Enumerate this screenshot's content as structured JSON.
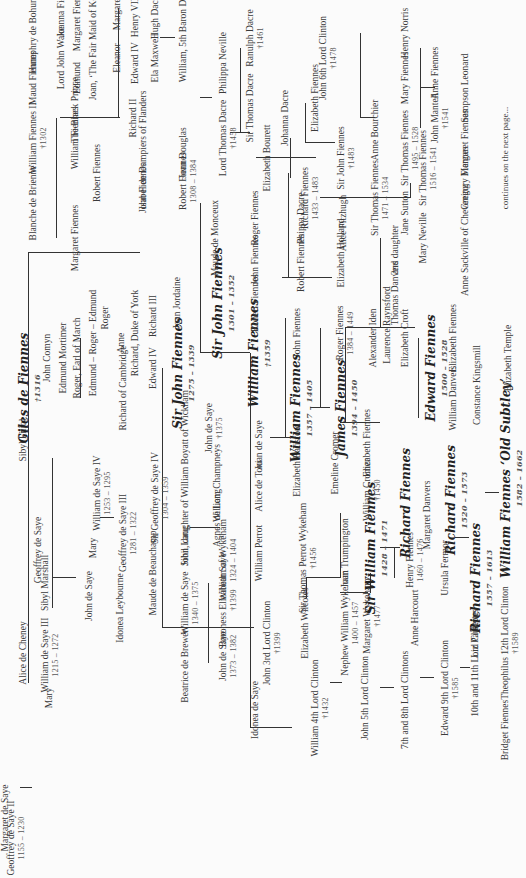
{
  "tree_title": "Fiennes family tree",
  "marriage_symbol": "∞",
  "people": [
    {
      "id": "geoffrey2",
      "name": "Geoffrey de Saye II",
      "dates": "1155 – 1230",
      "u": 40,
      "v": 6
    },
    {
      "id": "margaret_ws",
      "name": "Margaret de Saye",
      "u": 60,
      "v": -2
    },
    {
      "id": "alice_cheney",
      "name": "Alice de Cheney",
      "u": 225,
      "v": 18
    },
    {
      "id": "mary1",
      "name": "Mary",
      "u": 180,
      "v": 44
    },
    {
      "id": "william3",
      "name": "William de Saye III",
      "dates": "1215 – 1272",
      "u": 223,
      "v": 40
    },
    {
      "id": "sibyl_marshall",
      "name": "Sibyl Marshall",
      "u": 295,
      "v": 40
    },
    {
      "id": "geoffrey_de_saye_b",
      "name": "Geoffrey de Saye",
      "u": 328,
      "v": 33
    },
    {
      "id": "john_de_saye1",
      "name": "John de Saye",
      "u": 282,
      "v": 84
    },
    {
      "id": "mary2",
      "name": "Mary",
      "u": 330,
      "v": 88
    },
    {
      "id": "william4",
      "name": "William de Saye IV",
      "dates": "1253 – 1295",
      "u": 385,
      "v": 92
    },
    {
      "id": "sibyl_filiol",
      "name": "Sibyl Filiol",
      "u": 438,
      "v": 18
    },
    {
      "id": "idonea_leybourne",
      "name": "Idonea Leybourne",
      "u": 270,
      "v": 115
    },
    {
      "id": "geoffrey3",
      "name": "Geoffrey de Saye III",
      "dates": "1281 – 1322",
      "u": 345,
      "v": 118
    },
    {
      "id": "maude_beauchamp",
      "name": "Maude de Beauchamp",
      "u": 305,
      "v": 148
    },
    {
      "id": "geoffrey4",
      "name": "Sir Geoffrey de Saye IV",
      "dates": "1304 – 1359",
      "u": 380,
      "v": 150
    },
    {
      "id": "beatrice",
      "name": "Beatrice de Brewer",
      "u": 212,
      "v": 180
    },
    {
      "id": "william_ds",
      "name": "William de Saye",
      "dates": "1340 – 1375",
      "u": 275,
      "v": 180
    },
    {
      "id": "john_lang",
      "name": "John Lang",
      "u": 332,
      "v": 180
    },
    {
      "id": "sibil_boyatt",
      "name": "Sibil, daughter of William Boyatt of Wickham",
      "u": 400,
      "v": 180
    },
    {
      "id": "john_ds2",
      "name": "John de Saye",
      "dates": "1373 – 1382",
      "u": 222,
      "v": 218
    },
    {
      "id": "baroness_eliz",
      "name": "Baroness Elizabeth Saye",
      "dates": "†1399",
      "u": 278,
      "v": 218
    },
    {
      "id": "william_wykeham",
      "name": "William of Wykeham",
      "dates": "1324 – 1404",
      "u": 318,
      "v": 218
    },
    {
      "id": "agnes",
      "name": "Agnes de Long",
      "u": 360,
      "v": 212
    },
    {
      "id": "w_champneys",
      "name": "William Champneys",
      "u": 395,
      "v": 212
    },
    {
      "id": "idonea_ds",
      "name": "Idonea de Saye",
      "u": 168,
      "v": 250
    },
    {
      "id": "john3clinton",
      "name": "John 3rd Lord Clinton",
      "dates": "†1399",
      "u": 235,
      "v": 262
    },
    {
      "id": "william_perrot",
      "name": "William Perrot",
      "u": 325,
      "v": 254
    },
    {
      "id": "alice_toni",
      "name": "Alice de Toni",
      "u": 392,
      "v": 254
    },
    {
      "id": "john_ds3",
      "name": "John de Saye",
      "dates": "†1375",
      "u": 450,
      "v": 204
    },
    {
      "id": "william4clinton",
      "name": "William 4th Lord Clinton",
      "dates": "†1432",
      "u": 170,
      "v": 310
    },
    {
      "id": "elizabeth_wilcotes",
      "name": "Elizabeth Wilcotes",
      "u": 255,
      "v": 300
    },
    {
      "id": "thomas_perrot",
      "name": "Sir Thomas Perrot Wykeham",
      "dates": "†1456",
      "u": 320,
      "v": 298
    },
    {
      "id": "nephew_ww",
      "name": "Nephew William Wykeham",
      "dates": "1400 – 1457",
      "u": 255,
      "v": 340
    },
    {
      "id": "joan_trump",
      "name": "Joan Trumpington",
      "u": 325,
      "v": 340
    },
    {
      "id": "joan_ds",
      "name": "Joan de Saye",
      "u": 433,
      "v": 254
    },
    {
      "id": "eliz_batisford",
      "name": "Elizabeth Batisford",
      "u": 418,
      "v": 292
    },
    {
      "id": "emeline",
      "name": "Emeline Cromer",
      "u": 415,
      "v": 330
    },
    {
      "id": "john5clinton",
      "name": "John 5th Lord Clinton",
      "u": 180,
      "v": 360
    },
    {
      "id": "margaret_wyk",
      "name": "Margaret Wykeham",
      "dates": "†1477",
      "u": 262,
      "v": 362
    },
    {
      "id": "sir_william_f",
      "name": "Sir William Fiennes",
      "dates": "1428 – 1471",
      "u": 330,
      "v": 365,
      "big": true
    },
    {
      "id": "william_cromer",
      "name": "William Cromer",
      "dates": "†1450",
      "u": 388,
      "v": 362
    },
    {
      "id": "eliz_fiennes1",
      "name": "Elizabeth Fiennes",
      "u": 435,
      "v": 362
    },
    {
      "id": "clintons78",
      "name": "7th and 8th Lord Clintons",
      "u": 178,
      "v": 400
    },
    {
      "id": "anne_harcourt",
      "name": "Anne Harcourt",
      "u": 260,
      "v": 410
    },
    {
      "id": "henry_fiennes",
      "name": "Henry Fiennes",
      "dates": "1460 – 1476",
      "u": 318,
      "v": 405
    },
    {
      "id": "richard_f1",
      "name": "Richard Fiennes",
      "u": 375,
      "v": 400,
      "big": true
    },
    {
      "id": "margaret_danvers",
      "name": "Margaret Danvers",
      "u": 363,
      "v": 422
    },
    {
      "id": "edward9",
      "name": "Edward 9th Lord Clinton",
      "dates": "†1585",
      "u": 190,
      "v": 440
    },
    {
      "id": "ursula",
      "name": "Ursula Fermor",
      "u": 310,
      "v": 440
    },
    {
      "id": "richard_f2",
      "name": "Richard Fiennes",
      "dates": "1520 – 1573",
      "u": 378,
      "v": 445,
      "big": true
    },
    {
      "id": "liz_paulette",
      "name": "Liz Paulette",
      "u": 243,
      "v": 470
    },
    {
      "id": "richard_f3",
      "name": "Richard Fiennes",
      "dates": "1557 – 1613",
      "u": 300,
      "v": 470,
      "big": true
    },
    {
      "id": "clintons1011",
      "name": "10th and 11th Lord Clintons",
      "u": 215,
      "v": 470
    },
    {
      "id": "bridget",
      "name": "Bridget Fiennes",
      "u": 148,
      "v": 500
    },
    {
      "id": "theophilus",
      "name": "Theophilus 12th Lord Clinton",
      "dates": "†1589",
      "u": 235,
      "v": 500
    },
    {
      "id": "william_old_subtley",
      "name": "William Fiennes ‘Old Subtley’",
      "dates": "1582 – 1662",
      "u": 400,
      "v": 500,
      "big": true
    },
    {
      "id": "eliz_temple",
      "name": "Elizabeth Temple",
      "u": 520,
      "v": 503
    },
    {
      "id": "giles",
      "name": "Giles de Fiennes",
      "dates": "†1316",
      "u": 490,
      "v": 18,
      "big": true
    },
    {
      "id": "john_comyn",
      "name": "John Comyn",
      "u": 520,
      "v": 42
    },
    {
      "id": "edmund_mortimer",
      "name": "Edmund Mortimer",
      "u": 520,
      "v": 58
    },
    {
      "id": "roger_march",
      "name": "Roger, Earl of March",
      "u": 520,
      "v": 72
    },
    {
      "id": "mortimer_line",
      "name": "Edmund – Roger – Edmund",
      "u": 535,
      "v": 88
    },
    {
      "id": "roger2",
      "name": "Roger",
      "u": 560,
      "v": 100
    },
    {
      "id": "anne_m",
      "name": "Anne",
      "u": 535,
      "v": 116
    },
    {
      "id": "richard_cambridge",
      "name": "Richard of Cambridge",
      "u": 490,
      "v": 118
    },
    {
      "id": "richard_york",
      "name": "Richard, Duke of York",
      "u": 545,
      "v": 130
    },
    {
      "id": "edward4",
      "name": "Edward IV",
      "u": 510,
      "v": 148
    },
    {
      "id": "richard3",
      "name": "Richard III",
      "u": 562,
      "v": 148
    },
    {
      "id": "sir_john_f1",
      "name": "Sir John Fiennes",
      "dates": "1275 – 1339",
      "u": 505,
      "v": 172,
      "big": true
    },
    {
      "id": "joan_jordaine",
      "name": "Joan Jordaine",
      "u": 575,
      "v": 172
    },
    {
      "id": "sir_john_f2",
      "name": "Sir John Fiennes",
      "dates": "1301 – 1352",
      "u": 575,
      "v": 212,
      "big": true
    },
    {
      "id": "maude_monceux",
      "name": "Maude de Monceux",
      "u": 640,
      "v": 210
    },
    {
      "id": "william_f1",
      "name": "William Fiennes",
      "dates": "†1359",
      "u": 525,
      "v": 248,
      "big": true
    },
    {
      "id": "robert_f1",
      "name": "Robert Fiennes",
      "u": 575,
      "v": 250
    },
    {
      "id": "john_f1",
      "name": "John Fiennes",
      "u": 618,
      "v": 250
    },
    {
      "id": "roger_f1",
      "name": "Roger Fiennes",
      "u": 660,
      "v": 250
    },
    {
      "id": "william_f2",
      "name": "William Fiennes",
      "dates": "1357 – 1405",
      "u": 470,
      "v": 290,
      "big": true
    },
    {
      "id": "john_f2",
      "name": "John Fiennes",
      "u": 545,
      "v": 292
    },
    {
      "id": "robert_f2",
      "name": "Robert Fiennes",
      "u": 615,
      "v": 296
    },
    {
      "id": "phippa_dacre",
      "name": "Phippa Dacre",
      "u": 660,
      "v": 296
    },
    {
      "id": "james_f",
      "name": "James Fiennes",
      "dates": "1394 – 1450",
      "u": 470,
      "v": 335,
      "big": true
    },
    {
      "id": "roger_f2",
      "name": "Roger Fiennes",
      "dates": "1384 – 1449",
      "u": 545,
      "v": 335
    },
    {
      "id": "eliz_holland",
      "name": "Elizabeth Holland",
      "u": 625,
      "v": 336
    },
    {
      "id": "alexander_iden",
      "name": "Alexander Iden",
      "u": 540,
      "v": 368
    },
    {
      "id": "laurence_r",
      "name": "Laurence Raynsford",
      "u": 553,
      "v": 382
    },
    {
      "id": "eliz_croft",
      "name": "Elizabeth Croft",
      "u": 540,
      "v": 400
    },
    {
      "id": "thomas_danvers",
      "name": "Thomas Danvers",
      "u": 585,
      "v": 390
    },
    {
      "id": "second_daughter",
      "name": "2nd daughter",
      "u": 628,
      "v": 390
    },
    {
      "id": "edward_f",
      "name": "Edward Fiennes",
      "dates": "1500 – 1528",
      "u": 510,
      "v": 425,
      "big": true
    },
    {
      "id": "william_danvers",
      "name": "William Danvers",
      "u": 480,
      "v": 448
    },
    {
      "id": "eliz_fiennes2",
      "name": "Elizabeth Fiennes",
      "u": 540,
      "v": 448
    },
    {
      "id": "constance",
      "name": "Constance Kingsmill",
      "u": 493,
      "v": 472
    },
    {
      "id": "mary_neville",
      "name": "Mary Neville",
      "u": 640,
      "v": 418
    },
    {
      "id": "sir_thomas_f3",
      "name": "Sir Thomas Fiennes",
      "dates": "1516 – 1541",
      "u": 710,
      "v": 418
    },
    {
      "id": "anne_sackville",
      "name": "Anne Sackville of Chevening",
      "u": 638,
      "v": 460
    },
    {
      "id": "gregory",
      "name": "Gregory Fiennes",
      "u": 700,
      "v": 460
    },
    {
      "id": "john_fiennes_l",
      "name": "John Fiennes",
      "u": 690,
      "v": 138
    },
    {
      "id": "blanche",
      "name": "Blanche de Brienne",
      "u": 675,
      "v": 28
    },
    {
      "id": "william_f_ii",
      "name": "William Fiennes II",
      "dates": "†1302",
      "u": 740,
      "v": 28
    },
    {
      "id": "margaret_f1",
      "name": "Margaret Fiennes",
      "u": 640,
      "v": 70
    },
    {
      "id": "robert_f0",
      "name": "Robert Fiennes",
      "u": 705,
      "v": 92
    },
    {
      "id": "william_f0",
      "name": "William Fiennes",
      "u": 740,
      "v": 70
    },
    {
      "id": "robert_f_1308",
      "name": "Robert Fiennes",
      "dates": "1308 – 1384",
      "u": 697,
      "v": 178
    },
    {
      "id": "isabel",
      "name": "Isabel de Dampiers of Flanders",
      "u": 728,
      "v": 138
    },
    {
      "id": "joan_douglas",
      "name": "Joan Douglas",
      "u": 725,
      "v": 178
    },
    {
      "id": "lord_thomas_dacre",
      "name": "Lord Thomas Dacre",
      "dates": "†1458",
      "u": 740,
      "v": 218
    },
    {
      "id": "maud_f",
      "name": "Maud Fiennes",
      "u": 800,
      "v": 28
    },
    {
      "id": "humphry",
      "name": "Humphry de Bohun",
      "u": 842,
      "v": 28
    },
    {
      "id": "black_prince",
      "name": "The Black Prince",
      "u": 768,
      "v": 70
    },
    {
      "id": "lord_john_wake",
      "name": "Lord John Wake",
      "u": 820,
      "v": 56
    },
    {
      "id": "edmund_k",
      "name": "Edmund",
      "u": 800,
      "v": 72
    },
    {
      "id": "joanna_f",
      "name": "Joanna Fiennes",
      "u": 870,
      "v": 56
    },
    {
      "id": "margaret_f2",
      "name": "Margaret Fiennes",
      "u": 860,
      "v": 72
    },
    {
      "id": "joan_kent",
      "name": "Joan, ‘The Fair Maid of Kent’",
      "u": 835,
      "v": 88
    },
    {
      "id": "richard2",
      "name": "Richard II",
      "u": 760,
      "v": 128
    },
    {
      "id": "eleanor",
      "name": "Eleanor",
      "u": 820,
      "v": 112
    },
    {
      "id": "margaret_k",
      "name": "Margaret",
      "u": 865,
      "v": 112
    },
    {
      "id": "edward4b",
      "name": "Edward IV",
      "u": 815,
      "v": 130
    },
    {
      "id": "henry8",
      "name": "Henry VIII",
      "u": 862,
      "v": 130
    },
    {
      "id": "ela_maxwell",
      "name": "Ela Maxwell",
      "u": 820,
      "v": 150
    },
    {
      "id": "hugh_dacre",
      "name": "Hugh Dacre",
      "u": 862,
      "v": 150
    },
    {
      "id": "william_5baron",
      "name": "William, 5th Baron Dacre",
      "u": 845,
      "v": 178
    },
    {
      "id": "philippa",
      "name": "Philippa Neville",
      "u": 815,
      "v": 218
    },
    {
      "id": "sir_thomas_dacre",
      "name": "Sir Thomas Dacre",
      "u": 770,
      "v": 245
    },
    {
      "id": "ranulph",
      "name": "Ranulph Dacre",
      "dates": "†1461",
      "u": 840,
      "v": 245
    },
    {
      "id": "eliz_bourett",
      "name": "Elizabeth Bourett",
      "u": 720,
      "v": 262
    },
    {
      "id": "johanna_dacre",
      "name": "Johanna Dacre",
      "u": 760,
      "v": 280
    },
    {
      "id": "richard_f_1433",
      "name": "Richard Fiennes",
      "dates": "1433 – 1483",
      "u": 680,
      "v": 300
    },
    {
      "id": "alice_fitzhugh",
      "name": "Alice Fitzhugh",
      "u": 655,
      "v": 338
    },
    {
      "id": "sir_john_f3",
      "name": "Sir John Fiennes",
      "dates": "†1483",
      "u": 720,
      "v": 336
    },
    {
      "id": "eliz_fiennes3",
      "name": "Elizabeth Fiennes",
      "u": 780,
      "v": 310
    },
    {
      "id": "john6clinton",
      "name": "John 6th Lord Clinton",
      "dates": "†1478",
      "u": 820,
      "v": 318
    },
    {
      "id": "sir_thomas_f1",
      "name": "Sir Thomas Fiennes",
      "dates": "1471 – 1534",
      "u": 680,
      "v": 370
    },
    {
      "id": "anne_bourchier",
      "name": "Anne Bourchier",
      "u": 748,
      "v": 370
    },
    {
      "id": "jane_sutton",
      "name": "Jane Sutton",
      "u": 665,
      "v": 400
    },
    {
      "id": "sir_thomas_f2",
      "name": "Sir Thomas Fiennes",
      "dates": "1495 – 1528",
      "u": 730,
      "v": 400
    },
    {
      "id": "mary_f",
      "name": "Mary Fiennes",
      "u": 800,
      "v": 400
    },
    {
      "id": "henry_norris",
      "name": "Henry Norris",
      "u": 845,
      "v": 400
    },
    {
      "id": "john_mantell",
      "name": "John Mantell",
      "dates": "†1541",
      "u": 760,
      "v": 430
    },
    {
      "id": "anne_f",
      "name": "Anne Fiennes",
      "u": 805,
      "v": 430
    },
    {
      "id": "margaret_f3",
      "name": "Margaret Fiennes",
      "u": 735,
      "v": 460
    },
    {
      "id": "sampson",
      "name": "Sampson Leonard",
      "u": 790,
      "v": 460
    }
  ],
  "footer_note": "continues on the next page..."
}
